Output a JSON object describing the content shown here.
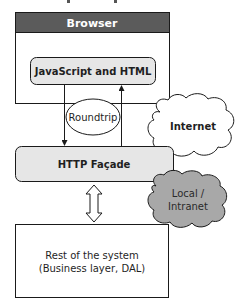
{
  "diagram": {
    "browser": {
      "title": "Browser"
    },
    "client_layer": {
      "label": "JavaScript and HTML"
    },
    "roundtrip": {
      "label": "Roundtrip"
    },
    "internet": {
      "label": "Internet"
    },
    "facade": {
      "label": "HTTP Façade"
    },
    "intranet": {
      "label_line1": "Local /",
      "label_line2": "Intranet"
    },
    "backend": {
      "label_line1": "Rest of the system",
      "label_line2": "(Business layer, DAL)"
    }
  },
  "colors": {
    "stroke": "#1a1a1a",
    "header_fill": "#5b5b5b",
    "box_fill": "#e6e6e6",
    "intranet_fill": "#a8a8a8",
    "text_dark": "#1f1f1f",
    "text_light": "#ffffff"
  }
}
